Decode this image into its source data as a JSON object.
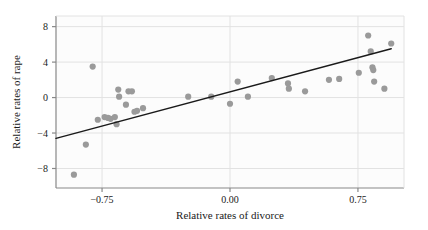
{
  "chart_data": {
    "type": "scatter",
    "title": "",
    "xlabel": "Relative rates of divorce",
    "ylabel": "Relative rates of rape",
    "xlim": [
      -1.02,
      1.02
    ],
    "ylim": [
      -10.2,
      9.2
    ],
    "xticks": [
      -0.75,
      0.0,
      0.75
    ],
    "xtick_labels": [
      "−0.75",
      "0.00",
      "0.75"
    ],
    "yticks": [
      8,
      4,
      0,
      -4,
      -8
    ],
    "ytick_labels": [
      "8",
      "4",
      "0",
      "−4",
      "−8"
    ],
    "grid": "horizontal-and-vertical-at-ticks",
    "legend": "none",
    "point_color": "#9a9a9a",
    "line_color": "#1a1a1a",
    "panel_color": "#fcfcfc",
    "frame_color": "#888888",
    "grid_color": "#e2e2e2",
    "points": [
      {
        "x": -0.915,
        "y": -8.7
      },
      {
        "x": -0.805,
        "y": 3.5
      },
      {
        "x": -0.845,
        "y": -5.3
      },
      {
        "x": -0.775,
        "y": -2.5
      },
      {
        "x": -0.735,
        "y": -2.2
      },
      {
        "x": -0.715,
        "y": -2.3
      },
      {
        "x": -0.7,
        "y": -2.4
      },
      {
        "x": -0.675,
        "y": -2.2
      },
      {
        "x": -0.665,
        "y": -3.0
      },
      {
        "x": -0.655,
        "y": 0.9
      },
      {
        "x": -0.65,
        "y": 0.1
      },
      {
        "x": -0.61,
        "y": -0.8
      },
      {
        "x": -0.595,
        "y": 0.7
      },
      {
        "x": -0.575,
        "y": 0.7
      },
      {
        "x": -0.56,
        "y": -1.6
      },
      {
        "x": -0.545,
        "y": -1.5
      },
      {
        "x": -0.51,
        "y": -1.2
      },
      {
        "x": -0.245,
        "y": 0.1
      },
      {
        "x": -0.11,
        "y": 0.1
      },
      {
        "x": 0.0,
        "y": -0.7
      },
      {
        "x": 0.045,
        "y": 1.8
      },
      {
        "x": 0.105,
        "y": 0.1
      },
      {
        "x": 0.245,
        "y": 2.2
      },
      {
        "x": 0.34,
        "y": 1.6
      },
      {
        "x": 0.345,
        "y": 1.0
      },
      {
        "x": 0.44,
        "y": 0.7
      },
      {
        "x": 0.58,
        "y": 2.0
      },
      {
        "x": 0.64,
        "y": 2.1
      },
      {
        "x": 0.755,
        "y": 2.8
      },
      {
        "x": 0.81,
        "y": 7.0
      },
      {
        "x": 0.825,
        "y": 5.2
      },
      {
        "x": 0.835,
        "y": 3.4
      },
      {
        "x": 0.84,
        "y": 3.1
      },
      {
        "x": 0.845,
        "y": 1.8
      },
      {
        "x": 0.905,
        "y": 1.0
      },
      {
        "x": 0.945,
        "y": 6.1
      }
    ],
    "fit_line": {
      "type": "linear-regression",
      "x_start": -1.02,
      "y_start": -4.6,
      "x_end": 0.945,
      "y_end": 5.5
    }
  }
}
